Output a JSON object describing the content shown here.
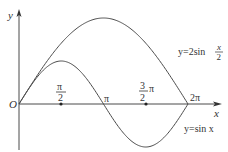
{
  "diagram": {
    "type": "function-graph",
    "axes": {
      "x_label": "x",
      "y_label": "y",
      "origin_label": "O"
    },
    "ticks": [
      {
        "id": "half_pi",
        "num": "π",
        "den": "2",
        "suffix": ""
      },
      {
        "id": "pi",
        "text": "π"
      },
      {
        "id": "three_half_pi",
        "num": "3",
        "den": "2",
        "suffix": "π"
      },
      {
        "id": "two_pi",
        "text": "2π"
      }
    ],
    "curves": [
      {
        "id": "sin_x",
        "label": "y=sin x",
        "equation": "y = sin(x)",
        "domain": [
          0,
          6.2832
        ]
      },
      {
        "id": "two_sin_half_x",
        "label_prefix": "y=2sin",
        "label_frac_num": "x",
        "label_frac_den": "2",
        "equation": "y = 2 sin(x/2)",
        "domain": [
          0,
          6.2832
        ]
      }
    ],
    "colors": {
      "stroke": "#4a4a4a",
      "text": "#333333",
      "background": "#ffffff"
    }
  }
}
